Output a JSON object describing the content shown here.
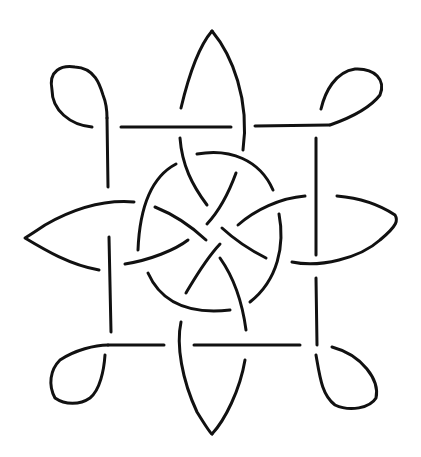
{
  "figure": {
    "stroke_color": "#111111",
    "background": "#ffffff",
    "width": 421,
    "height": 457,
    "strands": [
      {
        "name": "top-petal-left",
        "d": "M181,108 C190,70 200,45 212,31"
      },
      {
        "name": "top-petal-right",
        "d": "M212,31 C232,55 250,100 243,150"
      },
      {
        "name": "top-petal-inner",
        "d": "M180,138 C182,165 192,185 207,205"
      },
      {
        "name": "top-bar-left",
        "d": "M121,127 L231,127"
      },
      {
        "name": "top-bar-right",
        "d": "M255,126 L329,125"
      },
      {
        "name": "top-left-loop",
        "d": "M92,127 C70,125 52,110 52,90 C48,70 62,65 75,67 C95,68 100,85 103,95 C107,105 107,112 107,118"
      },
      {
        "name": "left-vertical-top",
        "d": "M107,118 L108,187"
      },
      {
        "name": "top-right-loop",
        "d": "M330,125 C350,118 370,108 380,95 C386,80 375,68 355,69 C335,72 325,92 321,109"
      },
      {
        "name": "right-vertical",
        "d": "M316,138 L316,255"
      },
      {
        "name": "right-vertical-lower",
        "d": "M316,278 L317,345"
      },
      {
        "name": "left-vertical-lower",
        "d": "M109,237 L111,332"
      },
      {
        "name": "left-petal",
        "d": "M134,202 C110,200 80,205 45,225 C30,235 25,238 25,238 C45,250 70,265 99,270"
      },
      {
        "name": "left-petal-inner",
        "d": "M125,264 C150,260 175,250 188,240"
      },
      {
        "name": "right-petal",
        "d": "M292,262 C320,268 360,258 380,240 C398,225 398,220 395,215 C380,205 360,198 337,196"
      },
      {
        "name": "right-petal-inner",
        "d": "M305,196 C280,198 255,210 238,225"
      },
      {
        "name": "circle-top-arc",
        "d": "M197,154 C230,148 260,160 273,190"
      },
      {
        "name": "circle-left-arc",
        "d": "M176,164 C155,175 140,200 138,250"
      },
      {
        "name": "circle-right-arc",
        "d": "M279,214 C285,245 278,280 250,302"
      },
      {
        "name": "circle-bottom-arc",
        "d": "M148,273 C160,300 185,315 230,310"
      },
      {
        "name": "spoke-1",
        "d": "M155,207 C175,215 190,225 206,240"
      },
      {
        "name": "spoke-2",
        "d": "M236,173 C228,195 220,210 207,224"
      },
      {
        "name": "spoke-3",
        "d": "M222,228 C235,240 250,250 266,258"
      },
      {
        "name": "spoke-4",
        "d": "M220,244 C205,260 195,278 186,293"
      },
      {
        "name": "bottom-petal-inner",
        "d": "M220,258 C232,275 242,300 246,330"
      },
      {
        "name": "bottom-bar-left",
        "d": "M108,345 L164,345"
      },
      {
        "name": "bottom-bar-right",
        "d": "M194,345 L300,345"
      },
      {
        "name": "bottom-left-loop",
        "d": "M108,345 C95,345 75,350 60,360 C50,370 48,385 55,398 C65,405 80,405 90,398 C100,390 104,370 105,355"
      },
      {
        "name": "bottom-right-loop",
        "d": "M316,355 C320,378 322,395 335,405 C350,412 370,408 376,398 C380,380 362,355 332,347"
      },
      {
        "name": "bottom-petal-left",
        "d": "M181,322 C176,345 182,380 197,412 C205,425 210,433 212,434"
      },
      {
        "name": "bottom-petal-right",
        "d": "M212,434 C225,420 240,390 245,360"
      }
    ]
  }
}
